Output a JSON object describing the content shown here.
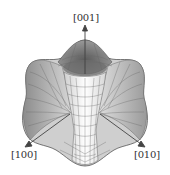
{
  "figure": {
    "type": "3D surface plot",
    "axes": {
      "z_label": "[001]",
      "x_label": "[100]",
      "y_label": "[010]"
    },
    "colors": {
      "background": "#ffffff",
      "surface_light": "#f2f2f2",
      "surface_mid": "#bdbdbd",
      "surface_dark": "#6e6e6e",
      "mesh_line": "#555555",
      "axis": "#444444",
      "label": "#333333"
    }
  }
}
